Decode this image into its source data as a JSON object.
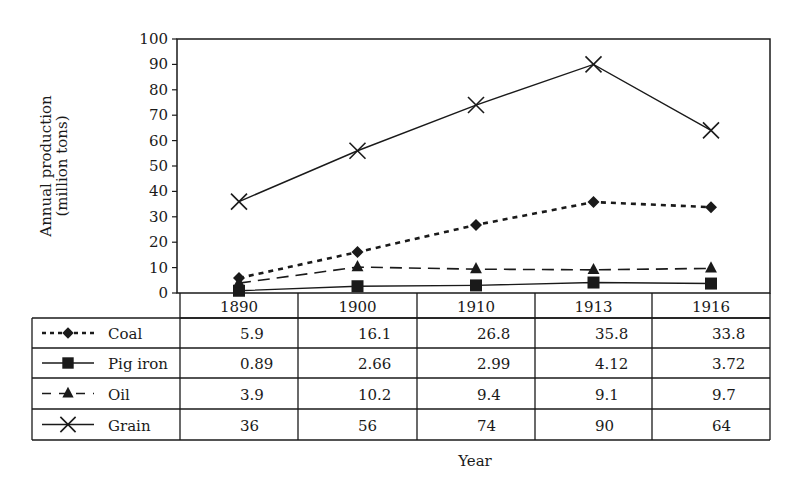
{
  "chart_data": {
    "type": "line",
    "title": "",
    "xlabel": "Year",
    "ylabel": "Annual production (million tons)",
    "ylabel_lines": [
      "Annual production",
      "(million tons)"
    ],
    "ylim": [
      0,
      100
    ],
    "yticks": [
      0,
      10,
      20,
      30,
      40,
      50,
      60,
      70,
      80,
      90,
      100
    ],
    "categories": [
      "1890",
      "1900",
      "1910",
      "1913",
      "1916"
    ],
    "grid": false,
    "legend_position": "table-below",
    "series": [
      {
        "name": "Coal",
        "values": [
          5.9,
          16.1,
          26.8,
          35.8,
          33.8
        ],
        "labels": [
          "5.9",
          "16.1",
          "26.8",
          "35.8",
          "33.8"
        ],
        "marker": "diamond",
        "line": "dotted"
      },
      {
        "name": "Pig iron",
        "values": [
          0.89,
          2.66,
          2.99,
          4.12,
          3.72
        ],
        "labels": [
          "0.89",
          "2.66",
          "2.99",
          "4.12",
          "3.72"
        ],
        "marker": "square",
        "line": "solid"
      },
      {
        "name": "Oil",
        "values": [
          3.9,
          10.2,
          9.4,
          9.1,
          9.7
        ],
        "labels": [
          "3.9",
          "10.2",
          "9.4",
          "9.1",
          "9.7"
        ],
        "marker": "triangle",
        "line": "dashed"
      },
      {
        "name": "Grain",
        "values": [
          36,
          56,
          74,
          90,
          64
        ],
        "labels": [
          "36",
          "56",
          "74",
          "90",
          "64"
        ],
        "marker": "x",
        "line": "solid"
      }
    ]
  },
  "colors": {
    "ink": "#1a1a1a",
    "background": "#ffffff"
  }
}
